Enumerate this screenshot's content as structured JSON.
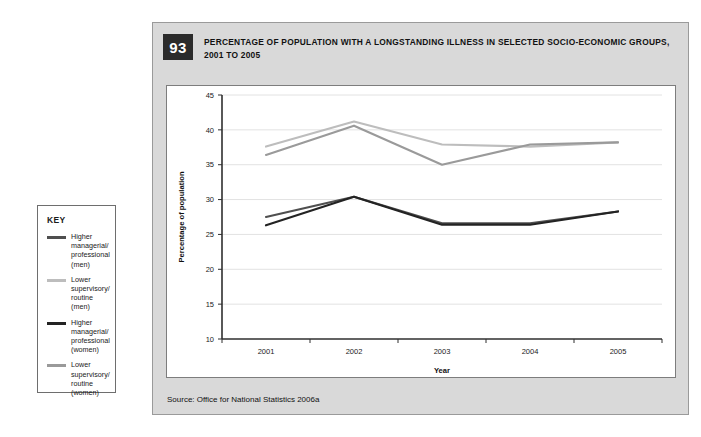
{
  "key_box": {
    "title": "KEY",
    "entries": [
      {
        "label": "Higher\nmanagerial/\nprofessional\n(men)",
        "color": "#4f4f4f"
      },
      {
        "label": "Lower\nsupervisory/\nroutine (men)",
        "color": "#bdbdbd"
      },
      {
        "label": "Higher\nmanagerial/\nprofessional\n(women)",
        "color": "#232323"
      },
      {
        "label": "Lower\nsupervisory/\nroutine (women)",
        "color": "#9a9a9a"
      }
    ]
  },
  "panel": {
    "number": "93",
    "title": "PERCENTAGE OF POPULATION WITH A LONGSTANDING ILLNESS IN SELECTED SOCIO-ECONOMIC GROUPS, 2001 TO 2005",
    "source": "Source: Office for National Statistics 2006a"
  },
  "chart_data": {
    "type": "line",
    "title": "PERCENTAGE OF POPULATION WITH A LONGSTANDING ILLNESS IN SELECTED SOCIO-ECONOMIC GROUPS, 2001 TO 2005",
    "xlabel": "Year",
    "ylabel": "Percentage of population",
    "categories": [
      "2001",
      "2002",
      "2003",
      "2004",
      "2005"
    ],
    "x_ticks": [
      "2001",
      "2002",
      "2003",
      "2004",
      "2005"
    ],
    "y_ticks": [
      10,
      15,
      20,
      25,
      30,
      35,
      40,
      45
    ],
    "ylim": [
      10,
      45
    ],
    "grid": "horizontal",
    "legend_position": "external-left",
    "series": [
      {
        "name": "Higher managerial/professional (men)",
        "color": "#4f4f4f",
        "values": [
          27.5,
          30.4,
          26.6,
          26.6,
          28.3
        ]
      },
      {
        "name": "Lower supervisory/routine (men)",
        "color": "#bdbdbd",
        "values": [
          37.6,
          41.2,
          37.9,
          37.6,
          38.2
        ]
      },
      {
        "name": "Higher managerial/professional (women)",
        "color": "#232323",
        "values": [
          26.3,
          30.4,
          26.4,
          26.4,
          28.3
        ]
      },
      {
        "name": "Lower supervisory/routine (women)",
        "color": "#9a9a9a",
        "values": [
          36.4,
          40.6,
          35.0,
          37.9,
          38.2
        ]
      }
    ]
  }
}
